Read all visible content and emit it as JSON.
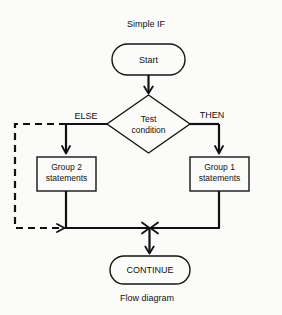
{
  "figure": {
    "title": "Simple IF",
    "caption": "Flow diagram",
    "width": 282,
    "height": 315,
    "background_color": "#fbfbfa",
    "line_color": "#111111"
  },
  "nodes": {
    "start": {
      "label": "Start",
      "shape": "stadium"
    },
    "decision": {
      "label_line1": "Test",
      "label_line2": "condition",
      "shape": "diamond"
    },
    "group2": {
      "label_line1": "Group 2",
      "label_line2": "statements",
      "shape": "rectangle"
    },
    "group1": {
      "label_line1": "Group 1",
      "label_line2": "statements",
      "shape": "rectangle"
    },
    "continue": {
      "label": "CONTINUE",
      "shape": "stadium"
    }
  },
  "branches": {
    "else_label": "ELSE",
    "then_label": "THEN"
  },
  "edges": [
    {
      "name": "start-to-decision",
      "from": "start",
      "to": "decision",
      "style": "solid"
    },
    {
      "name": "decision-else-to-group2",
      "from": "decision",
      "to": "group2",
      "style": "solid"
    },
    {
      "name": "decision-then-to-group1",
      "from": "decision",
      "to": "group1",
      "style": "solid"
    },
    {
      "name": "else-bypass",
      "from": "decision",
      "to": "merge",
      "style": "dashed"
    },
    {
      "name": "group2-to-merge",
      "from": "group2",
      "to": "merge",
      "style": "solid"
    },
    {
      "name": "group1-to-merge",
      "from": "group1",
      "to": "merge",
      "style": "solid"
    },
    {
      "name": "merge-to-continue",
      "from": "merge",
      "to": "continue",
      "style": "solid"
    }
  ]
}
